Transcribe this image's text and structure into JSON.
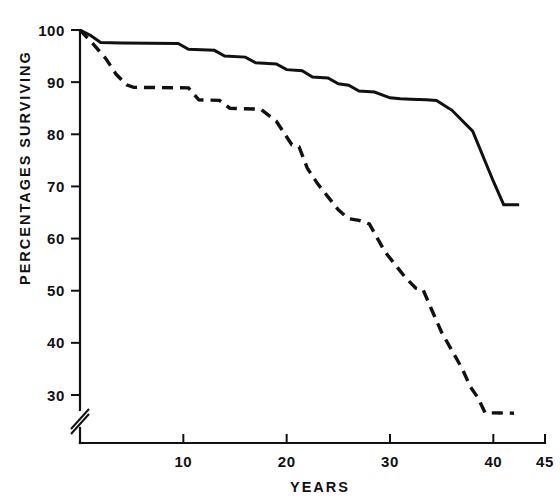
{
  "chart_data": {
    "type": "line",
    "title": "",
    "xlabel": "YEARS",
    "ylabel": "PERCENTAGES SURVIVING",
    "xlim": [
      0,
      45
    ],
    "ylim": [
      26,
      100
    ],
    "y_axis_break": true,
    "y_axis_break_note": "axis broken between 0 and 30",
    "grid": false,
    "legend": "none",
    "x_ticks": [
      10,
      20,
      30,
      40,
      45
    ],
    "x_tick_labels": [
      "10",
      "20",
      "30",
      "40",
      "45"
    ],
    "y_ticks": [
      30,
      40,
      50,
      60,
      70,
      80,
      90,
      100
    ],
    "y_tick_labels": [
      "30",
      "40",
      "50",
      "60",
      "70",
      "80",
      "90",
      "100"
    ],
    "series": [
      {
        "name": "solid-curve",
        "style": "solid",
        "color": "#111111",
        "x": [
          0,
          1,
          2,
          4,
          9.5,
          10.5,
          13,
          14,
          16,
          17,
          19,
          20,
          21.5,
          22.5,
          24,
          25,
          26,
          27,
          28.5,
          30,
          31,
          32,
          33.5,
          34.5,
          36,
          38,
          40,
          41,
          42.5
        ],
        "y": [
          100,
          99,
          97.6,
          97.5,
          97.4,
          96.3,
          96.1,
          95.0,
          94.8,
          93.7,
          93.5,
          92.4,
          92.2,
          91.0,
          90.8,
          89.7,
          89.4,
          88.3,
          88.1,
          87.0,
          86.8,
          86.7,
          86.6,
          86.5,
          84.6,
          80.6,
          71.0,
          66.5,
          66.5
        ]
      },
      {
        "name": "dashed-curve",
        "style": "dashed",
        "color": "#111111",
        "x": [
          0,
          1.2,
          2.5,
          3.5,
          4.5,
          5.2,
          10.5,
          11.5,
          13.5,
          14.5,
          17.5,
          19.0,
          20.5,
          21.2,
          22.0,
          23.0,
          24.0,
          25.0,
          26.0,
          27.0,
          28.0,
          28.8,
          29.5,
          30.5,
          31.5,
          32.5,
          33.2,
          34.0,
          35.0,
          36.0,
          37.0,
          37.8,
          38.5,
          39.2,
          42.0
        ],
        "y": [
          100,
          97.5,
          94.5,
          91.5,
          89.5,
          89.0,
          88.9,
          86.6,
          86.5,
          85.0,
          84.8,
          82.5,
          78.0,
          77.6,
          73.5,
          70.5,
          68.0,
          65.5,
          63.8,
          63.5,
          62.8,
          60.0,
          57.5,
          55.0,
          52.5,
          50.5,
          50.2,
          46.5,
          42.0,
          38.5,
          35.0,
          31.5,
          29.5,
          26.6,
          26.5
        ]
      }
    ]
  },
  "axes": {
    "x_title": "YEARS",
    "y_title": "PERCENTAGES SURVIVING"
  }
}
